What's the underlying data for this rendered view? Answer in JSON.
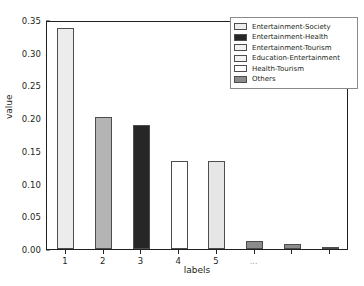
{
  "chart_data": {
    "type": "bar",
    "title": "",
    "xlabel": "labels",
    "ylabel": "value",
    "categories": [
      "1",
      "2",
      "3",
      "4",
      "5",
      "...",
      "",
      ""
    ],
    "values": [
      0.338,
      0.202,
      0.189,
      0.135,
      0.134,
      0.013,
      0.007,
      0.003
    ],
    "bar_colors": [
      "#ececec",
      "#b4b4b4",
      "#262626",
      "#ffffff",
      "#e6e6e6",
      "#8c8c8c",
      "#8c8c8c",
      "#8c8c8c"
    ],
    "bar_edge_color": "#4d4d4d",
    "ylim": [
      0.0,
      0.35
    ],
    "yticks": [
      "0.00",
      "0.05",
      "0.10",
      "0.15",
      "0.20",
      "0.25",
      "0.30",
      "0.35"
    ],
    "ytick_values": [
      0.0,
      0.05,
      0.1,
      0.15,
      0.2,
      0.25,
      0.3,
      0.35
    ],
    "grid": false,
    "legend_position": "upper right",
    "legend": [
      {
        "label": "Entertainment-Society",
        "color": "#ececec"
      },
      {
        "label": "Entertainment-Health",
        "color": "#262626"
      },
      {
        "label": "Entertainment-Tourism",
        "color": "#f2f2f2"
      },
      {
        "label": "Education-Entertainment",
        "color": "#f2f2f2"
      },
      {
        "label": "Health-Tourism",
        "color": "#ffffff"
      },
      {
        "label": "Others",
        "color": "#8c8c8c"
      }
    ]
  }
}
